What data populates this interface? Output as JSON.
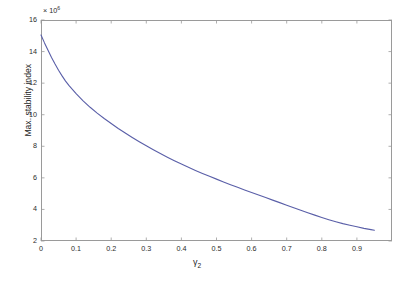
{
  "chart_data": {
    "type": "line",
    "title": "",
    "xlabel": "γ₂",
    "ylabel": "Max. stability index",
    "y_exponent_label": "× 10",
    "y_exponent_value": "6",
    "y_scale_factor": 1000000,
    "xlim": [
      0,
      1
    ],
    "ylim": [
      2,
      16
    ],
    "xticks": [
      0,
      0.1,
      0.2,
      0.3,
      0.4,
      0.5,
      0.6,
      0.7,
      0.8,
      0.9
    ],
    "xticklabels": [
      "0",
      "0.1",
      "0.2",
      "0.3",
      "0.4",
      "0.5",
      "0.6",
      "0.7",
      "0.8",
      "0.9"
    ],
    "yticks": [
      2,
      4,
      6,
      8,
      10,
      12,
      14,
      16
    ],
    "yticklabels": [
      "2",
      "4",
      "6",
      "8",
      "10",
      "12",
      "14",
      "16"
    ],
    "grid": false,
    "legend": null,
    "series": [
      {
        "name": "Max. stability index",
        "color": "#5a5fa8",
        "linewidth": 1.1,
        "x": [
          0.0,
          0.01,
          0.02,
          0.03,
          0.04,
          0.05,
          0.06,
          0.07,
          0.08,
          0.1,
          0.12,
          0.14,
          0.16,
          0.18,
          0.2,
          0.22,
          0.24,
          0.26,
          0.28,
          0.3,
          0.32,
          0.34,
          0.36,
          0.38,
          0.4,
          0.42,
          0.44,
          0.46,
          0.48,
          0.5,
          0.52,
          0.54,
          0.56,
          0.58,
          0.6,
          0.62,
          0.64,
          0.66,
          0.68,
          0.7,
          0.72,
          0.74,
          0.76,
          0.78,
          0.8,
          0.82,
          0.84,
          0.86,
          0.88,
          0.9,
          0.92,
          0.94,
          0.95
        ],
        "y": [
          15.05,
          14.55,
          14.08,
          13.63,
          13.21,
          12.82,
          12.46,
          12.13,
          11.84,
          11.33,
          10.88,
          10.47,
          10.1,
          9.76,
          9.44,
          9.13,
          8.84,
          8.56,
          8.29,
          8.03,
          7.78,
          7.54,
          7.31,
          7.09,
          6.88,
          6.67,
          6.47,
          6.28,
          6.1,
          5.92,
          5.74,
          5.57,
          5.4,
          5.23,
          5.07,
          4.91,
          4.75,
          4.59,
          4.43,
          4.27,
          4.11,
          3.95,
          3.79,
          3.64,
          3.49,
          3.35,
          3.22,
          3.1,
          3.0,
          2.9,
          2.8,
          2.72,
          2.68
        ]
      }
    ]
  },
  "axes": {
    "y_exponent_prefix": "× 10",
    "y_exponent_power": "6",
    "x_title_symbol": "γ",
    "x_title_subscript": "2",
    "y_title": "Max. stability index"
  }
}
